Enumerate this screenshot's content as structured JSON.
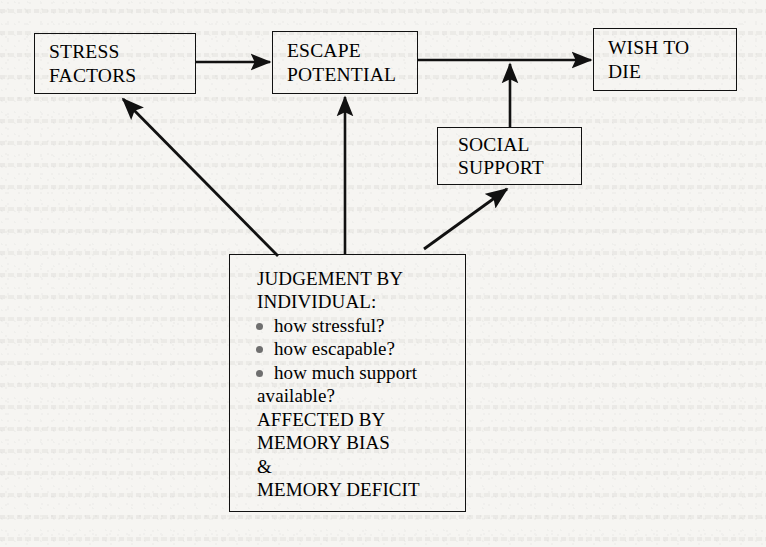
{
  "diagram": {
    "background_color": "#f6f5f2",
    "line_color": "#111111",
    "bullet_color": "#6f6f6f",
    "nodes": [
      {
        "id": "stress",
        "label": "STRESS\nFACTORS"
      },
      {
        "id": "escape",
        "label": "ESCAPE\nPOTENTIAL"
      },
      {
        "id": "wish",
        "label": "WISH TO\nDIE"
      },
      {
        "id": "social",
        "label": "SOCIAL\nSUPPORT"
      }
    ],
    "judgement": {
      "header": "JUDGEMENT BY\nINDIVIDUAL:",
      "bullets": [
        {
          "text": "how stressful?"
        },
        {
          "text": "how escapable?"
        },
        {
          "text": "how much support",
          "continuation": "available?"
        }
      ],
      "footer": "AFFECTED BY\nMEMORY BIAS\n&\nMEMORY DEFICIT"
    },
    "edges": [
      {
        "from": "stress",
        "to": "escape",
        "style": "horizontal-arrow"
      },
      {
        "from": "escape",
        "to": "wish",
        "style": "horizontal-arrow"
      },
      {
        "from": "social",
        "to": "wish",
        "style": "vertical-arrow-into-line"
      },
      {
        "from": "judgement",
        "to": "escape",
        "style": "vertical-arrow"
      },
      {
        "from": "judgement",
        "to": "social",
        "style": "diagonal-arrow-up-right"
      },
      {
        "from": "judgement",
        "to": "stress",
        "style": "diagonal-arrow-up-left"
      }
    ]
  }
}
